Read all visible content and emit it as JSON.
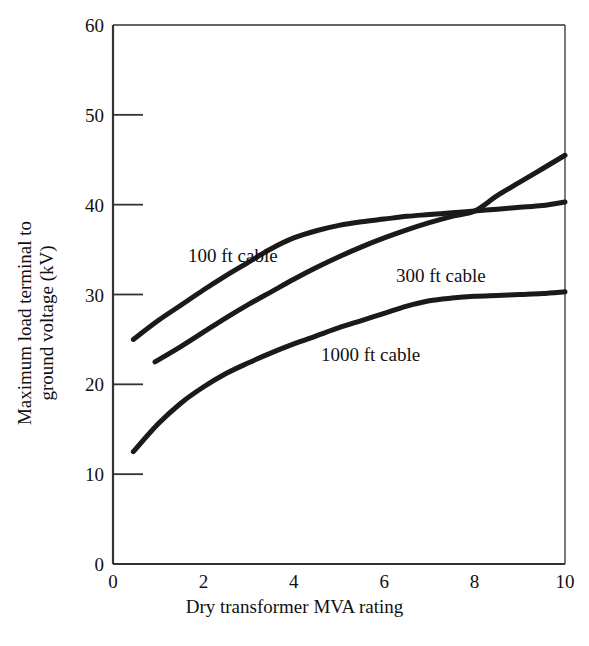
{
  "chart_data": {
    "type": "line",
    "title": "",
    "xlabel": "Dry transformer MVA rating",
    "ylabel_line1": "Maximum load terminal to",
    "ylabel_line2": "ground voltage (kV)",
    "xlim": [
      0,
      10
    ],
    "ylim": [
      0,
      60
    ],
    "xticks": [
      "0",
      "2",
      "4",
      "6",
      "8",
      "10"
    ],
    "xtick_values": [
      0,
      2,
      4,
      6,
      8,
      10
    ],
    "yticks": [
      "0",
      "10",
      "20",
      "30",
      "40",
      "50",
      "60"
    ],
    "ytick_values": [
      0,
      10,
      20,
      30,
      40,
      50,
      60
    ],
    "grid": false,
    "legend_position": "inline-annotations",
    "line_color": "#1a1a1a",
    "axis_color": "#333333",
    "series": [
      {
        "name": "100 ft cable",
        "label": "100 ft cable",
        "x": [
          0.45,
          1.0,
          1.5,
          2.0,
          2.5,
          3.0,
          3.5,
          4.0,
          4.5,
          5.0,
          5.5,
          6.0,
          6.5,
          7.0,
          7.5,
          8.0,
          8.5,
          9.0,
          9.5,
          10.0
        ],
        "y": [
          25.0,
          27.1,
          28.8,
          30.5,
          32.1,
          33.6,
          35.1,
          36.3,
          37.1,
          37.7,
          38.1,
          38.4,
          38.7,
          38.9,
          39.1,
          39.3,
          39.5,
          39.7,
          39.9,
          40.3
        ]
      },
      {
        "name": "300 ft cable",
        "label": "300 ft cable",
        "x": [
          0.93,
          1.5,
          2.0,
          2.5,
          3.0,
          3.5,
          4.0,
          4.5,
          5.0,
          5.5,
          6.0,
          6.5,
          7.0,
          7.5,
          8.0,
          8.5,
          9.0,
          9.5,
          10.0
        ],
        "y": [
          22.5,
          24.2,
          25.8,
          27.4,
          28.9,
          30.3,
          31.7,
          33.0,
          34.2,
          35.3,
          36.3,
          37.2,
          38.0,
          38.7,
          39.3,
          41.0,
          42.5,
          44.0,
          45.5
        ]
      },
      {
        "name": "1000 ft cable",
        "label": "1000 ft cable",
        "x": [
          0.45,
          1.0,
          1.5,
          2.0,
          2.5,
          3.0,
          3.5,
          4.0,
          4.5,
          5.0,
          5.5,
          6.0,
          6.5,
          7.0,
          7.5,
          8.0,
          8.5,
          9.0,
          9.5,
          10.0
        ],
        "y": [
          12.5,
          15.6,
          17.9,
          19.7,
          21.2,
          22.4,
          23.5,
          24.5,
          25.4,
          26.3,
          27.1,
          27.9,
          28.7,
          29.3,
          29.6,
          29.8,
          29.9,
          30.0,
          30.1,
          30.3
        ]
      }
    ]
  },
  "annotations": {
    "cable_100ft": "100 ft cable",
    "cable_300ft": "300 ft cable",
    "cable_1000ft": "1000 ft cable"
  }
}
